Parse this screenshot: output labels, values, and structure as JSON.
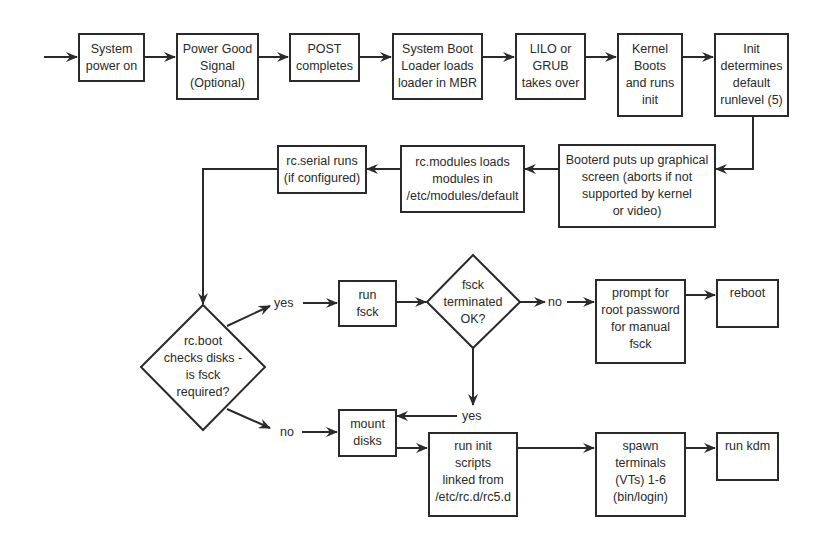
{
  "diagram": {
    "type": "flowchart",
    "nodes": {
      "power_on": "System\npower on",
      "power_good": "Power Good\nSignal\n(Optional)",
      "post": "POST\ncompletes",
      "boot_loader": "System Boot\nLoader loads\nloader in MBR",
      "lilo_grub": "LILO or\nGRUB\ntakes over",
      "kernel": "Kernel\nBoots\nand runs\ninit",
      "init": "Init\ndetermines\ndefault\nrunlevel (5)",
      "booterd": "Booterd puts up graphical\nscreen (aborts if not\nsupported by kernel\nor video)",
      "rc_modules": "rc.modules loads\nmodules in\n/etc/modules/default",
      "rc_serial": "rc.serial runs\n(if configured)",
      "rc_boot": "rc.boot\nchecks disks -\nis fsck\nrequired?",
      "run_fsck": "run\nfsck",
      "fsck_ok": "fsck\nterminated\nOK?",
      "prompt_root": "prompt for\nroot password\nfor manual\nfsck",
      "reboot": "reboot",
      "mount_disks": "mount\ndisks",
      "run_init_scripts": "run init\nscripts\nlinked from\n/etc/rc.d/rc5.d",
      "spawn_terminals": "spawn\nterminals\n(VTs) 1-6\n(bin/login)",
      "run_kdm": "run kdm"
    },
    "labels": {
      "rc_boot_yes": "yes",
      "rc_boot_no": "no",
      "fsck_no": "no",
      "fsck_yes": "yes"
    },
    "edges": [
      [
        "start",
        "power_on"
      ],
      [
        "power_on",
        "power_good"
      ],
      [
        "power_good",
        "post"
      ],
      [
        "post",
        "boot_loader"
      ],
      [
        "boot_loader",
        "lilo_grub"
      ],
      [
        "lilo_grub",
        "kernel"
      ],
      [
        "kernel",
        "init"
      ],
      [
        "init",
        "booterd"
      ],
      [
        "booterd",
        "rc_modules"
      ],
      [
        "rc_modules",
        "rc_serial"
      ],
      [
        "rc_serial",
        "rc_boot"
      ],
      [
        "rc_boot",
        "run_fsck",
        "yes"
      ],
      [
        "rc_boot",
        "mount_disks",
        "no"
      ],
      [
        "run_fsck",
        "fsck_ok"
      ],
      [
        "fsck_ok",
        "prompt_root",
        "no"
      ],
      [
        "fsck_ok",
        "mount_disks",
        "yes"
      ],
      [
        "prompt_root",
        "reboot"
      ],
      [
        "mount_disks",
        "run_init_scripts"
      ],
      [
        "run_init_scripts",
        "spawn_terminals"
      ],
      [
        "spawn_terminals",
        "run_kdm"
      ]
    ],
    "colors": {
      "stroke": "#2a2a2a",
      "background": "#ffffff"
    }
  }
}
